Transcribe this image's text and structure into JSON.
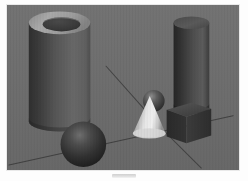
{
  "page": {
    "caption_mark": "",
    "background_color": "#ffffff",
    "frame_border_color": "#e9e9e9"
  },
  "scene": {
    "name": "raytraced-primitives-scene",
    "background_color": "#6e6e6e",
    "floor_color": "#6b6b6b",
    "lighting": "single key light from upper right",
    "line_color": "#3c3c3c",
    "objects": [
      {
        "id": "large-hollow-cylinder",
        "label": "Large hollow cylinder (tube)",
        "shape": "cylinder",
        "hollow": true,
        "bbox": {
          "x": 27,
          "y": 9,
          "w": 67,
          "h": 122
        },
        "colors": {
          "rim_top": "#a7a7a7",
          "body_light": "#6a6a6a",
          "body_dark": "#343434",
          "hole_interior": "#3a3a3a",
          "hole_rim_highlight": "#8e8e8e"
        }
      },
      {
        "id": "tall-dark-cylinder",
        "label": "Tall dark cylinder",
        "shape": "cylinder",
        "hollow": false,
        "bbox": {
          "x": 178,
          "y": 13,
          "w": 36,
          "h": 103
        },
        "colors": {
          "top_cap": "#565656",
          "body_light": "#5e5e5e",
          "body_dark": "#2a2a2a"
        }
      },
      {
        "id": "large-sphere",
        "label": "Large dark sphere",
        "shape": "sphere",
        "bbox": {
          "x": 60,
          "y": 124,
          "w": 46,
          "h": 46
        },
        "colors": {
          "highlight": "#6d6d6d",
          "mid": "#3a3a3a",
          "shadow": "#1c1c1c"
        }
      },
      {
        "id": "small-sphere",
        "label": "Small sphere behind cone",
        "shape": "sphere",
        "bbox": {
          "x": 148,
          "y": 93,
          "w": 22,
          "h": 22
        },
        "colors": {
          "highlight": "#8a8a8a",
          "mid": "#494949",
          "shadow": "#262626"
        }
      },
      {
        "id": "cone",
        "label": "Bright cone",
        "shape": "cone",
        "bbox": {
          "x": 132,
          "y": 98,
          "w": 34,
          "h": 40
        },
        "colors": {
          "highlight": "#ececec",
          "mid": "#b9b9b9",
          "shadow": "#707070"
        }
      },
      {
        "id": "cube",
        "label": "Dark cube",
        "shape": "cube",
        "bbox": {
          "x": 168,
          "y": 103,
          "w": 41,
          "h": 40
        },
        "colors": {
          "top": "#4e4e4e",
          "front": "#2e2e2e",
          "side": "#3f3f3f"
        }
      }
    ],
    "floor_lines": [
      {
        "id": "horizon-line",
        "label": "Receding horizon line",
        "from": [
          8,
          166
        ],
        "to": [
          233,
          116
        ]
      },
      {
        "id": "diagonal-line-left",
        "label": "Perspective line to upper left",
        "from": [
          105,
          66
        ],
        "to": [
          160,
          128
        ]
      },
      {
        "id": "diagonal-line-right",
        "label": "Perspective line to lower right",
        "from": [
          160,
          128
        ],
        "to": [
          200,
          168
        ]
      }
    ]
  }
}
